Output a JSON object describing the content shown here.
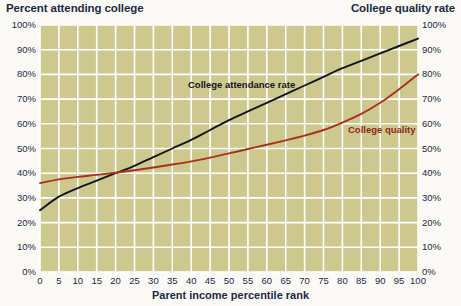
{
  "titles": {
    "left": "Percent attending college",
    "right": "College quality rate",
    "xaxis": "Parent income percentile rank"
  },
  "colors": {
    "plot_background": "#cdc88e",
    "grid": "#ffffff",
    "attendance_line": "#14161c",
    "quality_line": "#a8321c",
    "text": "#1d2a44",
    "page_background": "#fbfaf6"
  },
  "axes": {
    "y_left_ticks": [
      "0%",
      "10%",
      "20%",
      "30%",
      "40%",
      "50%",
      "60%",
      "70%",
      "80%",
      "90%",
      "100%"
    ],
    "y_right_ticks": [
      "0%",
      "10%",
      "20%",
      "30%",
      "40%",
      "50%",
      "60%",
      "70%",
      "80%",
      "90%",
      "100%"
    ],
    "x_ticks": [
      "0",
      "5",
      "10",
      "15",
      "20",
      "25",
      "30",
      "35",
      "40",
      "45",
      "50",
      "55",
      "60",
      "65",
      "70",
      "75",
      "80",
      "85",
      "90",
      "95",
      "100"
    ]
  },
  "series_labels": {
    "attendance": "College attendance rate",
    "quality": "College quality"
  },
  "chart_data": {
    "type": "line",
    "xlabel": "Parent income percentile rank",
    "ylabel": "Percent attending college",
    "y2label": "College quality rate",
    "xlim": [
      0,
      100
    ],
    "ylim": [
      0,
      100
    ],
    "y2lim": [
      0,
      100
    ],
    "grid": true,
    "legend": "inline-annotations",
    "x": [
      0,
      5,
      10,
      15,
      20,
      25,
      30,
      35,
      40,
      45,
      50,
      55,
      60,
      65,
      70,
      75,
      80,
      85,
      90,
      95,
      100
    ],
    "series": [
      {
        "name": "College attendance rate",
        "color": "#14161c",
        "axis": "left",
        "values": [
          25.0,
          30.5,
          34.0,
          37.0,
          40.0,
          43.0,
          46.5,
          50.0,
          53.5,
          57.5,
          61.5,
          65.0,
          68.5,
          72.0,
          75.5,
          79.0,
          82.5,
          85.5,
          88.5,
          91.5,
          94.5
        ]
      },
      {
        "name": "College quality",
        "color": "#a8321c",
        "axis": "right",
        "values": [
          36.0,
          37.5,
          38.5,
          39.3,
          40.2,
          41.2,
          42.3,
          43.5,
          44.8,
          46.3,
          48.0,
          49.8,
          51.5,
          53.3,
          55.2,
          57.5,
          60.5,
          64.0,
          68.5,
          74.0,
          80.0
        ]
      }
    ],
    "annotations": [
      {
        "text": "College attendance rate",
        "x": 40,
        "y": 72
      },
      {
        "text": "College quality",
        "x": 86,
        "y": 57
      }
    ]
  }
}
